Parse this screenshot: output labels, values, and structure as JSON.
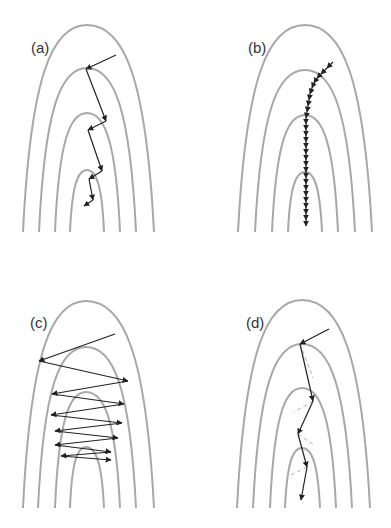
{
  "figure": {
    "colors": {
      "contour": "#a8a8a8",
      "path": "#222222",
      "dashed": "#b0b0b0",
      "background": "#ffffff"
    },
    "panels": [
      {
        "id": "a",
        "label": "(a)",
        "label_pos": [
          31,
          53
        ],
        "apex_x": 87,
        "tops": [
          25,
          68,
          113,
          170
        ],
        "bottom_y": 232,
        "bottoms_left": [
          23,
          39,
          55,
          70
        ],
        "bottoms_right": [
          154,
          136,
          120,
          104
        ],
        "path": [
          [
            116,
            55
          ],
          [
            86,
            69
          ],
          [
            106,
            121
          ],
          [
            88,
            130
          ],
          [
            102,
            171
          ],
          [
            89,
            179
          ],
          [
            93,
            200
          ],
          [
            84,
            206
          ]
        ],
        "arrow_style": "zigzag-perpendicular"
      },
      {
        "id": "b",
        "label": "(b)",
        "label_pos": [
          248,
          53
        ],
        "apex_x": 305,
        "tops": [
          25,
          70,
          115,
          172
        ],
        "bottom_y": 232,
        "bottoms_left": [
          238,
          255,
          272,
          288
        ],
        "bottoms_right": [
          372,
          355,
          338,
          322
        ],
        "path": [
          [
            333,
            62
          ],
          [
            327,
            68
          ],
          [
            321,
            74
          ],
          [
            317,
            78
          ],
          [
            314,
            83
          ],
          [
            312,
            88
          ],
          [
            310,
            94
          ],
          [
            309,
            100
          ],
          [
            308,
            106
          ],
          [
            307,
            112
          ],
          [
            306,
            118
          ],
          [
            306,
            124
          ],
          [
            306,
            130
          ],
          [
            306,
            136
          ],
          [
            306,
            142
          ],
          [
            306,
            148
          ],
          [
            306,
            154
          ],
          [
            306,
            160
          ],
          [
            306,
            166
          ],
          [
            306,
            172
          ],
          [
            306,
            178
          ],
          [
            306,
            184
          ],
          [
            306,
            190
          ],
          [
            306,
            196
          ],
          [
            306,
            202
          ],
          [
            306,
            208
          ],
          [
            306,
            214
          ],
          [
            306,
            220
          ],
          [
            306,
            226
          ]
        ],
        "arrow_style": "many-small-steps"
      },
      {
        "id": "c",
        "label": "(c)",
        "label_pos": [
          30,
          328
        ],
        "apex_x": 86,
        "tops": [
          301,
          347,
          392,
          447
        ],
        "bottom_y": 508,
        "bottoms_left": [
          23,
          38,
          55,
          70
        ],
        "bottoms_right": [
          154,
          136,
          120,
          104
        ],
        "path": [
          [
            115,
            334
          ],
          [
            39,
            361
          ],
          [
            128,
            381
          ],
          [
            52,
            394
          ],
          [
            124,
            404
          ],
          [
            51,
            415
          ],
          [
            122,
            423
          ],
          [
            55,
            431
          ],
          [
            118,
            438
          ],
          [
            55,
            445
          ],
          [
            111,
            452
          ],
          [
            61,
            456
          ],
          [
            111,
            460
          ]
        ],
        "arrow_style": "oscillating"
      },
      {
        "id": "d",
        "label": "(d)",
        "label_pos": [
          246,
          328
        ],
        "apex_x": 302,
        "tops": [
          300,
          344,
          388,
          448
        ],
        "bottom_y": 508,
        "bottoms_left": [
          237,
          253,
          270,
          285
        ],
        "bottoms_right": [
          370,
          352,
          336,
          320
        ],
        "path": [
          [
            329,
            329
          ],
          [
            300,
            344
          ],
          [
            313,
            401
          ],
          [
            298,
            434
          ],
          [
            307,
            467
          ],
          [
            301,
            500
          ]
        ],
        "dashed_segments": [
          [
            [
              300,
              344
            ],
            [
              313,
              378
            ]
          ],
          [
            [
              313,
              401
            ],
            [
              294,
              412
            ]
          ],
          [
            [
              298,
              434
            ],
            [
              315,
              446
            ]
          ],
          [
            [
              307,
              467
            ],
            [
              287,
              477
            ]
          ]
        ],
        "arrow_style": "momentum"
      }
    ]
  }
}
